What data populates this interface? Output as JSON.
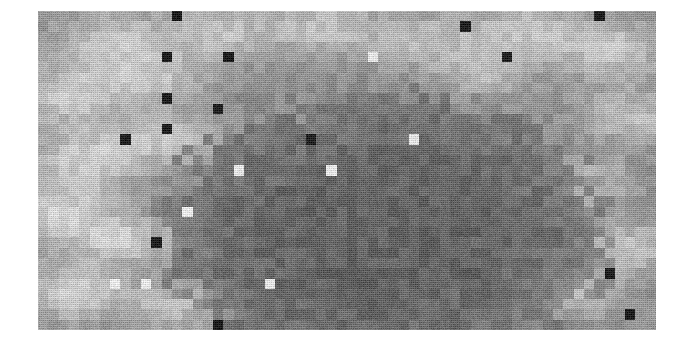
{
  "figure": {
    "title": "",
    "background_color": "#ffffff",
    "plot": {
      "x": 38,
      "y": 11,
      "width": 618,
      "height": 319
    }
  },
  "chart_data": {
    "type": "heatmap",
    "title": "",
    "subtitle": "",
    "xlabel": "",
    "ylabel": "",
    "legend": [],
    "annotations": [],
    "grid": false,
    "colormap": "grayscale",
    "colormap_min_hex": "#101010",
    "colormap_max_hex": "#ffffff",
    "value_range": [
      0,
      255
    ],
    "n_cols": 60,
    "n_rows": 31,
    "cell_width_px": 10.3,
    "cell_height_px": 10.3,
    "base_level": 145,
    "background_blobs": [
      {
        "cx": 0.12,
        "cy": 0.1,
        "r": 0.11,
        "level": 205
      },
      {
        "cx": 0.3,
        "cy": 0.07,
        "r": 0.1,
        "level": 200
      },
      {
        "cx": 0.46,
        "cy": 0.05,
        "r": 0.09,
        "level": 198
      },
      {
        "cx": 0.62,
        "cy": 0.09,
        "r": 0.1,
        "level": 196
      },
      {
        "cx": 0.79,
        "cy": 0.06,
        "r": 0.1,
        "level": 202
      },
      {
        "cx": 0.93,
        "cy": 0.12,
        "r": 0.1,
        "level": 206
      },
      {
        "cx": 0.05,
        "cy": 0.27,
        "r": 0.1,
        "level": 208
      },
      {
        "cx": 0.19,
        "cy": 0.22,
        "r": 0.09,
        "level": 196
      },
      {
        "cx": 0.08,
        "cy": 0.46,
        "r": 0.1,
        "level": 212
      },
      {
        "cx": 0.21,
        "cy": 0.4,
        "r": 0.09,
        "level": 198
      },
      {
        "cx": 0.03,
        "cy": 0.63,
        "r": 0.11,
        "level": 215
      },
      {
        "cx": 0.14,
        "cy": 0.72,
        "r": 0.09,
        "level": 204
      },
      {
        "cx": 0.06,
        "cy": 0.88,
        "r": 0.1,
        "level": 214
      },
      {
        "cx": 0.22,
        "cy": 0.93,
        "r": 0.08,
        "level": 196
      },
      {
        "cx": 0.96,
        "cy": 0.33,
        "r": 0.09,
        "level": 200
      },
      {
        "cx": 0.9,
        "cy": 0.54,
        "r": 0.08,
        "level": 192
      },
      {
        "cx": 0.97,
        "cy": 0.74,
        "r": 0.09,
        "level": 198
      },
      {
        "cx": 0.87,
        "cy": 0.88,
        "r": 0.09,
        "level": 196
      },
      {
        "cx": 0.72,
        "cy": 0.2,
        "r": 0.08,
        "level": 190
      }
    ],
    "dark_mass": {
      "cx": 0.56,
      "cy": 0.7,
      "rx": 0.36,
      "ry": 0.44,
      "level": 98
    },
    "outlier_cells": [
      {
        "col": 13,
        "row": 0,
        "level": 18
      },
      {
        "col": 54,
        "row": 0,
        "level": 20
      },
      {
        "col": 41,
        "row": 1,
        "level": 22
      },
      {
        "col": 63,
        "row": 1,
        "level": 22
      },
      {
        "col": 82,
        "row": 2,
        "level": 24
      },
      {
        "col": 12,
        "row": 4,
        "level": 20
      },
      {
        "col": 18,
        "row": 4,
        "level": 20
      },
      {
        "col": 32,
        "row": 4,
        "level": 238
      },
      {
        "col": 45,
        "row": 4,
        "level": 24
      },
      {
        "col": 60,
        "row": 4,
        "level": 22
      },
      {
        "col": 74,
        "row": 3,
        "level": 26
      },
      {
        "col": 12,
        "row": 8,
        "level": 22
      },
      {
        "col": 17,
        "row": 9,
        "level": 24
      },
      {
        "col": 12,
        "row": 11,
        "level": 22
      },
      {
        "col": 8,
        "row": 12,
        "level": 24
      },
      {
        "col": 26,
        "row": 12,
        "level": 26
      },
      {
        "col": 36,
        "row": 12,
        "level": 236
      },
      {
        "col": 28,
        "row": 15,
        "level": 242
      },
      {
        "col": 19,
        "row": 15,
        "level": 240
      },
      {
        "col": 14,
        "row": 19,
        "level": 244
      },
      {
        "col": 11,
        "row": 22,
        "level": 20
      },
      {
        "col": 7,
        "row": 26,
        "level": 244
      },
      {
        "col": 10,
        "row": 26,
        "level": 242
      },
      {
        "col": 22,
        "row": 26,
        "level": 238
      },
      {
        "col": 17,
        "row": 30,
        "level": 18
      },
      {
        "col": 55,
        "row": 25,
        "level": 20
      },
      {
        "col": 57,
        "row": 29,
        "level": 20
      },
      {
        "col": 67,
        "row": 24,
        "level": 22
      },
      {
        "col": 66,
        "row": 17,
        "level": 236
      },
      {
        "col": 78,
        "row": 22,
        "level": 240
      },
      {
        "col": 85,
        "row": 19,
        "level": 22
      },
      {
        "col": 71,
        "row": 13,
        "level": 20
      },
      {
        "col": 84,
        "row": 9,
        "level": 26
      },
      {
        "col": 88,
        "row": 11,
        "level": 24
      },
      {
        "col": 78,
        "row": 3,
        "level": 18
      },
      {
        "col": 70,
        "row": 1,
        "level": 24
      }
    ]
  },
  "image": {
    "alt_text": "Blocky grayscale heatmap with noisy background and scattered black and white outlier squares",
    "width": 677,
    "height": 347
  }
}
